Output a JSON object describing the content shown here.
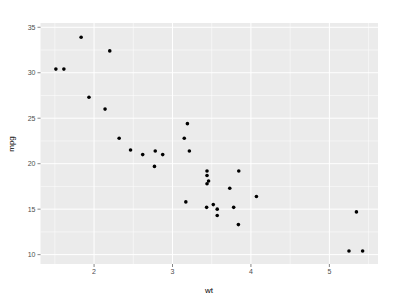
{
  "chart_data": {
    "type": "scatter",
    "title": "",
    "xlabel": "wt",
    "ylabel": "mpg",
    "xlim": [
      1.317,
      5.62
    ],
    "ylim": [
      8.97,
      35.47
    ],
    "xticks": [
      2,
      3,
      4,
      5
    ],
    "yticks": [
      10,
      15,
      20,
      25,
      30,
      35
    ],
    "grid": true,
    "legend": null,
    "points": [
      {
        "x": 2.62,
        "y": 21.0
      },
      {
        "x": 2.875,
        "y": 21.0
      },
      {
        "x": 2.32,
        "y": 22.8
      },
      {
        "x": 3.215,
        "y": 21.4
      },
      {
        "x": 3.44,
        "y": 18.7
      },
      {
        "x": 3.46,
        "y": 18.1
      },
      {
        "x": 3.57,
        "y": 14.3
      },
      {
        "x": 3.19,
        "y": 24.4
      },
      {
        "x": 3.15,
        "y": 22.8
      },
      {
        "x": 3.44,
        "y": 19.2
      },
      {
        "x": 3.44,
        "y": 17.8
      },
      {
        "x": 4.07,
        "y": 16.4
      },
      {
        "x": 3.73,
        "y": 17.3
      },
      {
        "x": 3.78,
        "y": 15.2
      },
      {
        "x": 5.25,
        "y": 10.4
      },
      {
        "x": 5.424,
        "y": 10.4
      },
      {
        "x": 5.345,
        "y": 14.7
      },
      {
        "x": 2.2,
        "y": 32.4
      },
      {
        "x": 1.615,
        "y": 30.4
      },
      {
        "x": 1.835,
        "y": 33.9
      },
      {
        "x": 2.465,
        "y": 21.5
      },
      {
        "x": 3.52,
        "y": 15.5
      },
      {
        "x": 3.435,
        "y": 15.2
      },
      {
        "x": 3.84,
        "y": 13.3
      },
      {
        "x": 3.845,
        "y": 19.2
      },
      {
        "x": 1.935,
        "y": 27.3
      },
      {
        "x": 2.14,
        "y": 26.0
      },
      {
        "x": 1.513,
        "y": 30.4
      },
      {
        "x": 3.17,
        "y": 15.8
      },
      {
        "x": 2.77,
        "y": 19.7
      },
      {
        "x": 3.57,
        "y": 15.0
      },
      {
        "x": 2.78,
        "y": 21.4
      }
    ]
  },
  "axes": {
    "x_label": "wt",
    "y_label": "mpg"
  },
  "colors": {
    "panel": "#ebebeb",
    "grid": "#ffffff",
    "point": "#000000"
  }
}
